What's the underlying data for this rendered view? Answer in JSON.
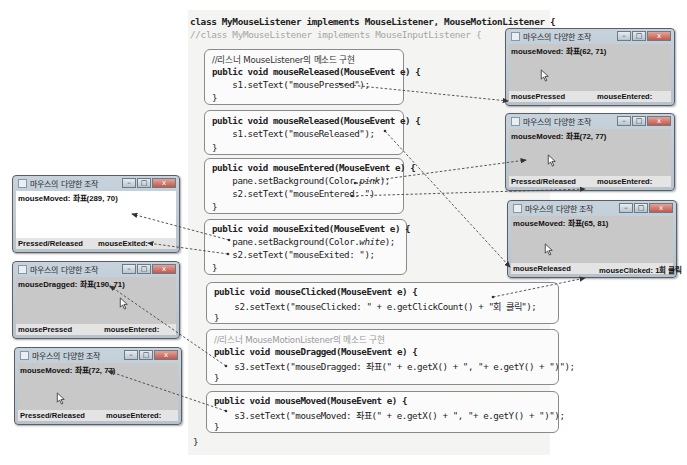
{
  "code": {
    "class_line": "class MyMouseListener implements MouseListener, MouseMotionListener {",
    "alt_class_line": "//class MyMouseListener implements MouseInputListener {",
    "closing_brace": "}",
    "blocks": [
      {
        "lines": [
          "//리스너 MouseListener의 메소드 구현",
          "public void mouseReleased(MouseEvent e) {",
          "    s1.setText(\"mousePressed\");",
          "}"
        ]
      },
      {
        "lines": [
          "public void mouseReleased(MouseEvent e) {",
          "    s1.setText(\"mouseReleased\");",
          "}"
        ]
      },
      {
        "lines": [
          "public void mouseEntered(MouseEvent e) {",
          "    pane.setBackground(Color.",
          "pink",
          ");",
          "    s2.setText(\"mouseEntered: \")",
          "}"
        ]
      },
      {
        "lines": [
          "public void mouseExited(MouseEvent e) {",
          "    pane.setBackground(Color.",
          "white",
          ");",
          "    s2.setText(\"mouseExited: \");",
          "}"
        ]
      },
      {
        "lines": [
          "public void mouseClicked(MouseEvent e) {",
          "    s2.setText(\"mouseClicked: \" + e.getClickCount() + \"회 클릭\");",
          "}"
        ]
      },
      {
        "lines": [
          "//리스너 MouseMotionListener의 메소드 구현",
          "public void mouseDragged(MouseEvent e) {",
          "    s3.setText(\"mouseDragged: 좌표(\" + e.getX() + \", \"+ e.getY() + \")\");",
          "}"
        ]
      },
      {
        "lines": [
          "public void mouseMoved(MouseEvent e) {",
          "    s3.setText(\"mouseMoved: 좌표(\" + e.getX() + \", \"+ e.getY() + \")\");",
          "}"
        ]
      }
    ]
  },
  "windows": [
    {
      "title": "마우스의 다양한 조작",
      "s3": "mouseMoved: 좌표(62, 71)",
      "s1": "mousePressed",
      "s2": "mouseEntered:",
      "background": "#c8c8c8"
    },
    {
      "title": "마우스의 다양한 조작",
      "s3": "mouseMoved: 좌표(72, 77)",
      "s1": "Pressed/Released",
      "s2": "mouseEntered:",
      "background": "#c8c8c8"
    },
    {
      "title": "마우스의 다양한 조작",
      "s3": "mouseMoved: 좌표(65, 81)",
      "s1": "mouseReleased",
      "s2": "mouseClicked: 1회 클릭",
      "background": "#c8c8c8"
    },
    {
      "title": "마우스의 다양한 조작",
      "s3": "mouseMoved: 좌표(289, 70)",
      "s1": "Pressed/Released",
      "s2": "mouseExited:",
      "background": "#ffffff"
    },
    {
      "title": "마우스의 다양한 조작",
      "s3": "mouseDragged: 좌표(190, 71)",
      "s1": "mousePressed",
      "s2": "mouseEntered:",
      "background": "#c8c8c8"
    },
    {
      "title": "마우스의 다양한 조작",
      "s3": "mouseMoved: 좌표(72, 77)",
      "s1": "Pressed/Released",
      "s2": "mouseEntered:",
      "background": "#c8c8c8"
    }
  ],
  "window_controls": {
    "minimize": "–",
    "maximize": "□",
    "close": "x"
  }
}
